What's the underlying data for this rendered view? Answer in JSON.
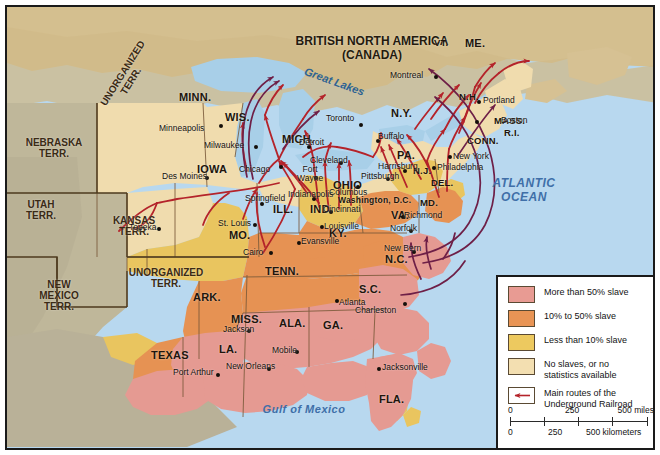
{
  "map": {
    "country_label": "BRITISH NORTH AMERICA\n(CANADA)",
    "oceans": [
      {
        "name": "atlantic",
        "text": "ATLANTIC\nOCEAN"
      },
      {
        "name": "gulf",
        "text": "Gulf of Mexico"
      }
    ],
    "water_features": [
      {
        "name": "great-lakes",
        "text": "Great Lakes"
      }
    ],
    "territories": [
      {
        "name": "unorganized-terr-north",
        "text": "UNORGANIZED\nTERR."
      },
      {
        "name": "nebraska-terr",
        "text": "NEBRASKA\nTERR."
      },
      {
        "name": "utah-terr",
        "text": "UTAH\nTERR."
      },
      {
        "name": "new-mexico-terr",
        "text": "NEW\nMEXICO\nTERR."
      },
      {
        "name": "kansas-terr",
        "text": "KANSAS\nTERR."
      },
      {
        "name": "unorganized-terr-south",
        "text": "UNORGANIZED\nTERR."
      }
    ],
    "states": [
      {
        "name": "minn",
        "text": "MINN."
      },
      {
        "name": "wis",
        "text": "WIS."
      },
      {
        "name": "iowa",
        "text": "IOWA"
      },
      {
        "name": "mich",
        "text": "MICH."
      },
      {
        "name": "ill",
        "text": "ILL."
      },
      {
        "name": "ind",
        "text": "IND."
      },
      {
        "name": "ohio",
        "text": "OHIO"
      },
      {
        "name": "mo",
        "text": "MO."
      },
      {
        "name": "ky",
        "text": "KY."
      },
      {
        "name": "tenn",
        "text": "TENN."
      },
      {
        "name": "ark",
        "text": "ARK."
      },
      {
        "name": "miss",
        "text": "MISS."
      },
      {
        "name": "ala",
        "text": "ALA."
      },
      {
        "name": "ga",
        "text": "GA."
      },
      {
        "name": "la",
        "text": "LA."
      },
      {
        "name": "texas",
        "text": "TEXAS"
      },
      {
        "name": "fla",
        "text": "FLA."
      },
      {
        "name": "sc",
        "text": "S.C."
      },
      {
        "name": "nc",
        "text": "N.C."
      },
      {
        "name": "va",
        "text": "VA."
      },
      {
        "name": "md",
        "text": "MD."
      },
      {
        "name": "del",
        "text": "DEL."
      },
      {
        "name": "nj",
        "text": "N.J."
      },
      {
        "name": "pa",
        "text": "PA."
      },
      {
        "name": "ny",
        "text": "N.Y."
      },
      {
        "name": "conn",
        "text": "CONN."
      },
      {
        "name": "ri",
        "text": "R.I."
      },
      {
        "name": "mass",
        "text": "MASS."
      },
      {
        "name": "nh",
        "text": "N.H."
      },
      {
        "name": "vt",
        "text": "VT."
      },
      {
        "name": "me",
        "text": "ME."
      },
      {
        "name": "dc",
        "text": "Washington, D.C."
      }
    ],
    "cities": [
      {
        "name": "minneapolis",
        "text": "Minneapolis"
      },
      {
        "name": "des-moines",
        "text": "Des Moines"
      },
      {
        "name": "milwaukee",
        "text": "Milwaukee"
      },
      {
        "name": "chicago",
        "text": "Chicago"
      },
      {
        "name": "detroit",
        "text": "Detroit"
      },
      {
        "name": "toronto",
        "text": "Toronto"
      },
      {
        "name": "montreal",
        "text": "Montreal"
      },
      {
        "name": "portland",
        "text": "Portland"
      },
      {
        "name": "boston",
        "text": "Boston"
      },
      {
        "name": "buffalo",
        "text": "Buffalo"
      },
      {
        "name": "cleveland",
        "text": "Cleveland"
      },
      {
        "name": "fort-wayne",
        "text": "Fort\nWayne"
      },
      {
        "name": "indianapolis",
        "text": "Indianapolis"
      },
      {
        "name": "columbus",
        "text": "Columbus"
      },
      {
        "name": "cincinnati",
        "text": "Cincinnati"
      },
      {
        "name": "pittsburgh",
        "text": "Pittsburgh"
      },
      {
        "name": "harrisburg",
        "text": "Harrisburg"
      },
      {
        "name": "new-york",
        "text": "New York"
      },
      {
        "name": "philadelphia",
        "text": "Philadelphia"
      },
      {
        "name": "richmond",
        "text": "Richmond"
      },
      {
        "name": "norfolk",
        "text": "Norfolk"
      },
      {
        "name": "new-bern",
        "text": "New Bern"
      },
      {
        "name": "charleston",
        "text": "Charleston"
      },
      {
        "name": "atlanta",
        "text": "Atlanta"
      },
      {
        "name": "jacksonville",
        "text": "Jacksonville"
      },
      {
        "name": "mobile",
        "text": "Mobile"
      },
      {
        "name": "jackson",
        "text": "Jackson"
      },
      {
        "name": "new-orleans",
        "text": "New Orleans"
      },
      {
        "name": "port-arthur",
        "text": "Port Arthur"
      },
      {
        "name": "louisville",
        "text": "Louisville"
      },
      {
        "name": "evansville",
        "text": "Evansville"
      },
      {
        "name": "cairo",
        "text": "Cairo"
      },
      {
        "name": "st-louis",
        "text": "St. Louis"
      },
      {
        "name": "springfield",
        "text": "Springfield"
      },
      {
        "name": "topeka",
        "text": "Topeka"
      }
    ]
  },
  "legend": {
    "items": [
      {
        "name": "more-than-50",
        "label": "More than 50% slave",
        "color": "#e89b93"
      },
      {
        "name": "10-to-50",
        "label": "10% to 50% slave",
        "color": "#e89455"
      },
      {
        "name": "less-than-10",
        "label": "Less than 10% slave",
        "color": "#edc95f"
      },
      {
        "name": "no-slaves",
        "label": "No slaves, or no\nstatistics available",
        "color": "#f3dfb1"
      },
      {
        "name": "main-routes",
        "label": "Main routes of the\nUnderground Railroad",
        "color": "#b4232a"
      }
    ],
    "scale": {
      "miles": {
        "ticks": [
          "0",
          "250",
          "500 miles"
        ]
      },
      "kilometers": {
        "ticks": [
          "0",
          "250",
          "500 kilometers"
        ]
      }
    }
  },
  "colors": {
    "ocean": "#b8d8ef",
    "route": "#b4232a",
    "border_dark": "#1a1a1a"
  }
}
